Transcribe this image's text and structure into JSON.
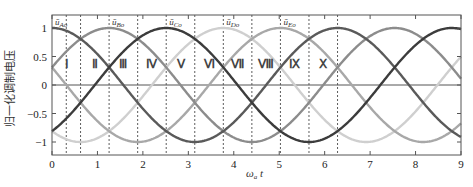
{
  "chart_data": {
    "type": "line",
    "title": "",
    "xlabel": "ω_a t",
    "ylabel": "归一化调制电压",
    "xlim": [
      0,
      9
    ],
    "ylim": [
      -1.2,
      1.2
    ],
    "x_ticks": [
      0,
      1,
      2,
      3,
      4,
      5,
      6,
      7,
      8,
      9
    ],
    "y_ticks": [
      -1,
      -0.5,
      0,
      0.5,
      1
    ],
    "y_tick_labels": [
      "−1",
      "−0.5",
      "0",
      "0.5",
      "1"
    ],
    "grid": false,
    "series": [
      {
        "name": "ū_Ao",
        "label": "ū_Ao",
        "func": "cos(t)",
        "phase": 0,
        "color": "#5a5a5a",
        "peak_x": 0
      },
      {
        "name": "ū_Bo",
        "label": "ū_Bo",
        "func": "cos(t - 2π/5)",
        "phase": 1.2566,
        "color": "#8c8c8c",
        "peak_x": 1.2566
      },
      {
        "name": "ū_Co",
        "label": "ū_Co",
        "func": "cos(t - 4π/5)",
        "phase": 2.5133,
        "color": "#3c3c3c",
        "peak_x": 2.5133
      },
      {
        "name": "ū_Do",
        "label": "ū_Do",
        "func": "cos(t - 6π/5)",
        "phase": 3.7699,
        "color": "#cfcfcf",
        "peak_x": 3.7699
      },
      {
        "name": "ū_Eo",
        "label": "ū_Eo",
        "func": "cos(t - 8π/5)",
        "phase": 5.0265,
        "color": "#a8a8a8",
        "peak_x": 5.0265
      }
    ],
    "sector_boundaries": [
      0.3142,
      0.6283,
      1.2566,
      1.885,
      2.5133,
      3.1416,
      3.7699,
      4.3982,
      5.0265,
      5.6549,
      6.2832
    ],
    "regions": [
      {
        "label": "Ⅰ",
        "x": 0.34
      },
      {
        "label": "Ⅱ",
        "x": 0.94
      },
      {
        "label": "Ⅲ",
        "x": 1.57
      },
      {
        "label": "Ⅳ",
        "x": 2.2
      },
      {
        "label": "Ⅴ",
        "x": 2.83
      },
      {
        "label": "Ⅵ",
        "x": 3.46
      },
      {
        "label": "Ⅶ",
        "x": 4.08
      },
      {
        "label": "Ⅷ",
        "x": 4.71
      },
      {
        "label": "Ⅸ",
        "x": 5.34
      },
      {
        "label": "Ⅹ",
        "x": 5.97
      }
    ]
  }
}
